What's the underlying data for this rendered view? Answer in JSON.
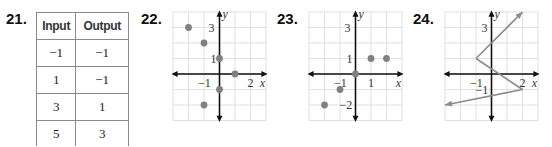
{
  "problems": [
    {
      "number": "21.",
      "type": "table",
      "headers": [
        "Input",
        "Output"
      ],
      "rows": [
        [
          "−1",
          "−1"
        ],
        [
          "1",
          "−1"
        ],
        [
          "3",
          "1"
        ],
        [
          "5",
          "3"
        ]
      ]
    },
    {
      "number": "22.",
      "type": "scatter",
      "points": [
        [
          -2,
          3
        ],
        [
          -1,
          2
        ],
        [
          0,
          1
        ],
        [
          1,
          0
        ],
        [
          0,
          -1
        ],
        [
          -1,
          -2
        ]
      ],
      "labels": {
        "y_tick": "3",
        "y_tick2": "1",
        "x_tick_neg": "−1",
        "x_tick_pos": "2",
        "x_axis": "x",
        "y_axis": "y"
      }
    },
    {
      "number": "23.",
      "type": "scatter",
      "points": [
        [
          -2,
          -2
        ],
        [
          -1,
          -1
        ],
        [
          0,
          0
        ],
        [
          1,
          1
        ],
        [
          2,
          1
        ]
      ],
      "labels": {
        "y_tick": "3",
        "y_tick2": "1",
        "y_tick3": "−2",
        "x_tick_neg": "−1",
        "x_tick_pos": "1",
        "x_axis": "x",
        "y_axis": "y"
      }
    },
    {
      "number": "24.",
      "type": "line",
      "segments": [
        [
          [
            -1,
            1
          ],
          [
            2,
            4
          ]
        ],
        [
          [
            -1,
            1
          ],
          [
            2,
            -1
          ]
        ],
        [
          [
            2,
            -1
          ],
          [
            -3,
            -2
          ]
        ]
      ],
      "labels": {
        "y_tick": "3",
        "y_tick2": "−1",
        "x_tick_neg": "−1",
        "x_tick_pos": "2",
        "x_axis": "x",
        "y_axis": "y"
      }
    }
  ],
  "colors": {
    "point": "#808080",
    "grid": "#e0e0e0",
    "axis": "#111111",
    "line": "#8c8c8c"
  }
}
